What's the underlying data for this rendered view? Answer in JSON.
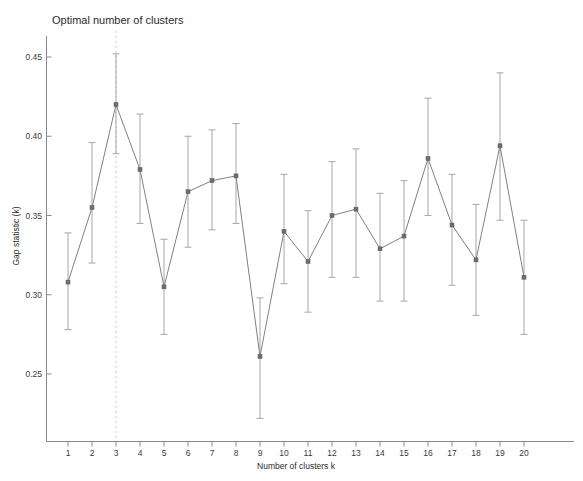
{
  "chart_data": {
    "type": "line",
    "title": "Optimal number of clusters",
    "xlabel": "Number of clusters k",
    "ylabel": "Gap statistic (k)",
    "categories": [
      "1",
      "2",
      "3",
      "4",
      "5",
      "6",
      "7",
      "8",
      "9",
      "10",
      "11",
      "12",
      "13",
      "14",
      "15",
      "16",
      "17",
      "18",
      "19",
      "20"
    ],
    "x": [
      1,
      2,
      3,
      4,
      5,
      6,
      7,
      8,
      9,
      10,
      11,
      12,
      13,
      14,
      15,
      16,
      17,
      18,
      19,
      20
    ],
    "values": [
      0.308,
      0.355,
      0.42,
      0.379,
      0.305,
      0.365,
      0.372,
      0.375,
      0.261,
      0.34,
      0.321,
      0.35,
      0.354,
      0.329,
      0.337,
      0.386,
      0.344,
      0.322,
      0.394,
      0.311
    ],
    "error_lower": [
      0.278,
      0.32,
      0.389,
      0.345,
      0.275,
      0.33,
      0.341,
      0.345,
      0.222,
      0.307,
      0.289,
      0.311,
      0.311,
      0.296,
      0.296,
      0.35,
      0.306,
      0.287,
      0.347,
      0.275
    ],
    "error_upper": [
      0.339,
      0.396,
      0.452,
      0.414,
      0.335,
      0.4,
      0.404,
      0.408,
      0.298,
      0.376,
      0.353,
      0.384,
      0.392,
      0.364,
      0.372,
      0.424,
      0.376,
      0.357,
      0.44,
      0.347
    ],
    "ytick_labels": [
      "0.45",
      "0.40",
      "0.35",
      "0.30",
      "0.25"
    ],
    "ytick_values": [
      0.45,
      0.4,
      0.35,
      0.3,
      0.25
    ],
    "ylim": [
      0.215,
      0.465
    ],
    "xlim": [
      0.4,
      20.7
    ],
    "grid": false,
    "legend": null,
    "annotations": [
      {
        "name": "optimal-k-marker",
        "type": "vertical-dashed-line",
        "x": 3,
        "label": "optimal k = 3"
      }
    ],
    "colors": {
      "line": "#808080",
      "marker": "#6e6e6e",
      "errorbar": "#a6a6a6",
      "vline": "#d9d3c3",
      "axis": "#8a8a8a",
      "text": "#2b2b2b"
    },
    "series": [
      {
        "name": "Gap statistic",
        "values": [
          0.308,
          0.355,
          0.42,
          0.379,
          0.305,
          0.365,
          0.372,
          0.375,
          0.261,
          0.34,
          0.321,
          0.35,
          0.354,
          0.329,
          0.337,
          0.386,
          0.344,
          0.322,
          0.394,
          0.311
        ]
      }
    ]
  }
}
